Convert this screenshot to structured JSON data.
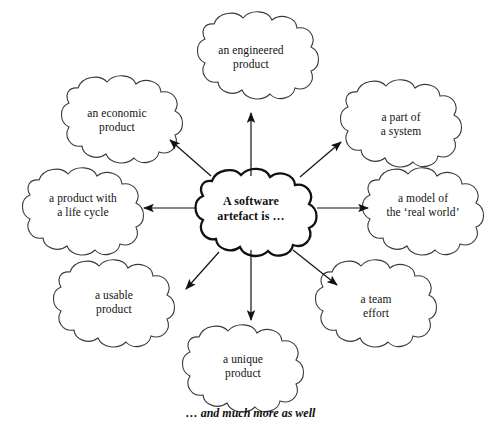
{
  "diagram": {
    "title_node": {
      "id": "center",
      "text": "A software\nartefact is …"
    },
    "nodes": [
      {
        "id": "engineered",
        "text": "an engineered\nproduct",
        "position": "top"
      },
      {
        "id": "economic",
        "text": "an economic\nproduct",
        "position": "top-left"
      },
      {
        "id": "part-of-system",
        "text": "a part of\na system",
        "position": "top-right"
      },
      {
        "id": "life-cycle",
        "text": "a product with\na life cycle",
        "position": "left"
      },
      {
        "id": "model",
        "text": "a model of\nthe ‘real world’",
        "position": "right"
      },
      {
        "id": "usable",
        "text": "a usable\nproduct",
        "position": "bottom-left"
      },
      {
        "id": "team-effort",
        "text": "a team\neffort",
        "position": "bottom-right"
      },
      {
        "id": "unique",
        "text": "a unique\nproduct",
        "position": "bottom"
      }
    ],
    "caption": "… and much more as well",
    "colors": {
      "background": "#ffffff",
      "cloud_outline": "#3a3a3a",
      "center_outline": "#111111",
      "text": "#111111",
      "arrow": "#111111"
    }
  }
}
